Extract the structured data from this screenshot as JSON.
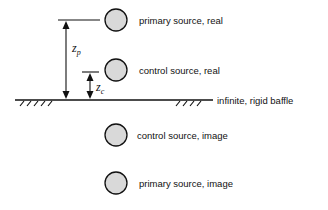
{
  "diagram": {
    "sources": [
      {
        "id": "primary-real",
        "label": "primary source, real",
        "cx": 116,
        "cy": 20
      },
      {
        "id": "control-real",
        "label": "control source, real",
        "cx": 116,
        "cy": 70
      },
      {
        "id": "control-image",
        "label": "control source, image",
        "cx": 116,
        "cy": 135
      },
      {
        "id": "primary-image",
        "label": "primary source, image",
        "cx": 116,
        "cy": 183
      }
    ],
    "baffle": {
      "label": "infinite, rigid baffle"
    },
    "dimensions": {
      "zp": {
        "symbol": "z",
        "subscript": "p"
      },
      "zc": {
        "symbol": "z",
        "subscript": "c"
      }
    },
    "colors": {
      "circle_fill": "#d9d9d9",
      "stroke": "#111111"
    }
  }
}
